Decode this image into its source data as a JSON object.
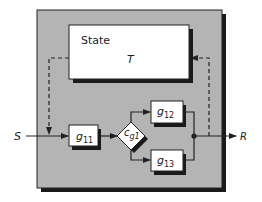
{
  "diagram": {
    "state_block": {
      "title": "State",
      "symbol": "T"
    },
    "input_label": "S",
    "output_label": "R",
    "blocks": [
      {
        "id": "g11",
        "base": "g",
        "sub": "11"
      },
      {
        "id": "g12",
        "base": "g",
        "sub": "12"
      },
      {
        "id": "g13",
        "base": "g",
        "sub": "13"
      }
    ],
    "condition": {
      "id": "cg1",
      "base": "c",
      "sub": "g1"
    },
    "colors": {
      "panel": "#b4b4b4",
      "shadow": "#1a1a1a",
      "block_fill": "#ffffff",
      "line": "#222222"
    }
  }
}
